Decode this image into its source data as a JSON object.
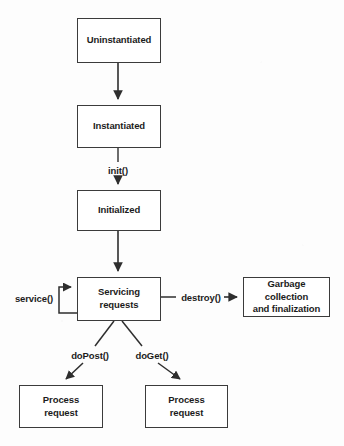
{
  "diagram": {
    "type": "flowchart",
    "stroke_color": "#3b3b3b",
    "text_color": "#1c1c1c",
    "background_color": "#ffffff",
    "nodes": [
      {
        "id": "uninstantiated",
        "label": "Uninstantiated",
        "x": 77,
        "y": 18,
        "w": 84,
        "h": 45
      },
      {
        "id": "instantiated",
        "label": "Instantiated",
        "x": 77,
        "y": 105,
        "w": 84,
        "h": 43
      },
      {
        "id": "initialized",
        "label": "Initialized",
        "x": 77,
        "y": 190,
        "w": 84,
        "h": 41
      },
      {
        "id": "servicing-requests",
        "label_line1": "Servicing",
        "label_line2": "requests",
        "x": 77,
        "y": 277,
        "w": 84,
        "h": 44
      },
      {
        "id": "garbage-collection",
        "label_line1": "Garbage collection",
        "label_line2": "and finalization",
        "x": 243,
        "y": 277,
        "w": 87,
        "h": 40
      },
      {
        "id": "process-request-left",
        "label_line1": "Process",
        "label_line2": "request",
        "x": 19,
        "y": 385,
        "w": 84,
        "h": 43
      },
      {
        "id": "process-request-right",
        "label_line1": "Process",
        "label_line2": "request",
        "x": 145,
        "y": 385,
        "w": 83,
        "h": 43
      }
    ],
    "edge_labels": [
      {
        "id": "init",
        "text": "init()",
        "x": 118,
        "y": 170
      },
      {
        "id": "service",
        "text": "service()",
        "x": 34,
        "y": 298
      },
      {
        "id": "destroy",
        "text": "destroy()",
        "x": 201,
        "y": 297
      },
      {
        "id": "dopost",
        "text": "doPost()",
        "x": 90,
        "y": 355
      },
      {
        "id": "doget",
        "text": "doGet()",
        "x": 152,
        "y": 355
      }
    ],
    "edges": [
      {
        "id": "uninstantiated-to-instantiated",
        "from": "uninstantiated",
        "to": "instantiated",
        "label": ""
      },
      {
        "id": "instantiated-to-initialized",
        "from": "instantiated",
        "to": "initialized",
        "label": "init()"
      },
      {
        "id": "initialized-to-servicing",
        "from": "initialized",
        "to": "servicing-requests",
        "label": ""
      },
      {
        "id": "servicing-self-loop",
        "from": "servicing-requests",
        "to": "servicing-requests",
        "label": "service()"
      },
      {
        "id": "servicing-to-garbage",
        "from": "servicing-requests",
        "to": "garbage-collection",
        "label": "destroy()"
      },
      {
        "id": "servicing-to-process-left",
        "from": "servicing-requests",
        "to": "process-request-left",
        "label": "doPost()"
      },
      {
        "id": "servicing-to-process-right",
        "from": "servicing-requests",
        "to": "process-request-right",
        "label": "doGet()"
      }
    ]
  }
}
